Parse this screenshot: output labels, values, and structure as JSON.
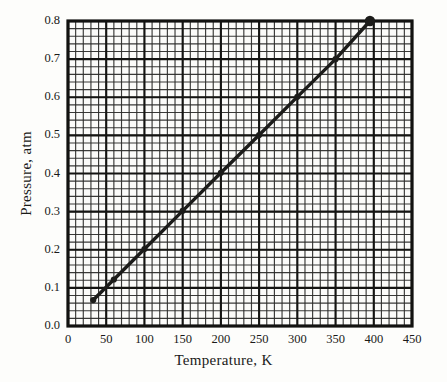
{
  "chart_data": {
    "type": "line",
    "title": "",
    "xlabel": "Temperature, K",
    "ylabel": "Pressure, atm",
    "xlim": [
      0,
      450
    ],
    "ylim": [
      0.0,
      0.8
    ],
    "xticks": [
      0,
      50,
      100,
      150,
      200,
      250,
      300,
      350,
      400,
      450
    ],
    "xtick_labels": [
      "0",
      "50",
      "100",
      "150",
      "200",
      "250",
      "300",
      "350",
      "400",
      "450"
    ],
    "yticks": [
      0.0,
      0.1,
      0.2,
      0.3,
      0.4,
      0.5,
      0.6,
      0.7,
      0.8
    ],
    "ytick_labels": [
      "0.0",
      "0.1",
      "0.2",
      "0.3",
      "0.4",
      "0.5",
      "0.6",
      "0.7",
      "0.8"
    ],
    "x_minor_step": 10,
    "y_minor_step": 0.02,
    "grid": true,
    "grid_color": "#2a2a28",
    "legend": false,
    "series": [
      {
        "name": "Pressure vs Temperature",
        "line_color": "#1c1c1a",
        "marker": "circle",
        "x": [
          33,
          60,
          100,
          150,
          200,
          250,
          300,
          350,
          395
        ],
        "y": [
          0.068,
          0.122,
          0.202,
          0.302,
          0.402,
          0.501,
          0.601,
          0.7,
          0.8
        ]
      }
    ]
  }
}
